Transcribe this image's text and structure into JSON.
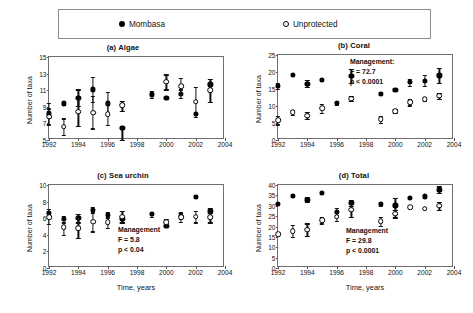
{
  "legend": {
    "items": [
      {
        "label": "Mombasa",
        "marker": "filled-circle-icon"
      },
      {
        "label": "Unprotected",
        "marker": "open-circle-icon"
      }
    ]
  },
  "axis_common": {
    "xlabel": "Time, years",
    "ylabel": "Number of taxa",
    "xlim": [
      1992,
      2004
    ],
    "xticks": [
      1992,
      1994,
      1996,
      1998,
      2000,
      2002,
      2004
    ]
  },
  "chart_data": [
    {
      "type": "scatter",
      "panel": "a",
      "title": "(a) Algae",
      "title_tag": "(a)",
      "title_name": "Algae",
      "xlabel": "",
      "ylabel": "Number of taxa",
      "xlim": [
        1992,
        2004
      ],
      "ylim": [
        5,
        15
      ],
      "yticks": [
        5,
        7,
        9,
        11,
        13,
        15
      ],
      "xticks": [
        1992,
        1994,
        1996,
        1998,
        2000,
        2002,
        2004
      ],
      "grid": false,
      "annotation": null,
      "series": [
        {
          "name": "Mombasa",
          "marker": "filled-circle",
          "x": [
            1992,
            1993,
            1994,
            1995,
            1996,
            1997,
            1999,
            2000,
            2001,
            2002,
            2003
          ],
          "values": [
            8.2,
            9.4,
            10.1,
            11.1,
            9.4,
            6.5,
            10.5,
            10.1,
            10.6,
            8.1,
            11.7
          ],
          "err_low": [
            1.3,
            0.0,
            1.0,
            1.5,
            1.2,
            1.5,
            0.4,
            0.0,
            0.5,
            0.0,
            0.0
          ],
          "err_high": [
            1.3,
            0.0,
            1.0,
            1.5,
            1.4,
            0.0,
            0.4,
            0.0,
            0.5,
            0.0,
            0.0
          ]
        },
        {
          "name": "Unprotected",
          "marker": "open-circle",
          "x": [
            1992,
            1993,
            1994,
            1995,
            1996,
            1997,
            2000,
            2001,
            2002,
            2003
          ],
          "values": [
            7.8,
            6.6,
            8.4,
            8.3,
            8.1,
            9.2,
            12.0,
            11.5,
            9.6,
            11.0
          ],
          "err_low": [
            1.0,
            1.0,
            1.7,
            1.9,
            1.3,
            0.7,
            0.9,
            1.0,
            1.8,
            1.4
          ],
          "err_high": [
            1.0,
            1.0,
            1.7,
            2.0,
            1.3,
            0.5,
            0.9,
            1.0,
            1.8,
            1.4
          ]
        }
      ]
    },
    {
      "type": "scatter",
      "panel": "b",
      "title": "(b) Coral",
      "title_tag": "(b)",
      "title_name": "Coral",
      "xlabel": "",
      "ylabel": "Number of taxa",
      "xlim": [
        1992,
        2004
      ],
      "ylim": [
        0,
        25
      ],
      "yticks": [
        0,
        5,
        10,
        15,
        20,
        25
      ],
      "xticks": [
        1992,
        1994,
        1996,
        1998,
        2000,
        2002,
        2004
      ],
      "grid": false,
      "annotation": {
        "line1": "Management:",
        "line2": "F = 72.7",
        "line3": "p <  0.0001"
      },
      "series": [
        {
          "name": "Mombasa",
          "marker": "filled-circle",
          "x": [
            1992,
            1993,
            1994,
            1995,
            1996,
            1997,
            1999,
            2000,
            2001,
            2002,
            2003
          ],
          "values": [
            16.0,
            19.2,
            16.6,
            17.7,
            10.8,
            18.8,
            13.6,
            14.8,
            17.0,
            17.5,
            19.0
          ],
          "err_low": [
            0.9,
            0.0,
            1.1,
            0.0,
            0.5,
            2.0,
            0.4,
            0.4,
            1.0,
            1.6,
            2.2
          ],
          "err_high": [
            0.9,
            0.0,
            1.1,
            0.0,
            0.5,
            2.0,
            0.4,
            0.4,
            1.0,
            1.6,
            2.2
          ]
        },
        {
          "name": "Unprotected",
          "marker": "open-circle",
          "x": [
            1992,
            1993,
            1994,
            1995,
            1997,
            1999,
            2000,
            2001,
            2002,
            2003
          ],
          "values": [
            5.8,
            8.1,
            7.2,
            9.3,
            12.2,
            6.1,
            8.5,
            11.1,
            12.0,
            13.0
          ],
          "err_low": [
            1.2,
            0.6,
            1.0,
            1.3,
            0.8,
            1.0,
            0.5,
            0.9,
            0.6,
            0.8
          ],
          "err_high": [
            1.2,
            0.6,
            1.0,
            1.3,
            0.8,
            1.0,
            0.5,
            0.9,
            0.6,
            0.8
          ]
        }
      ]
    },
    {
      "type": "scatter",
      "panel": "c",
      "title": "(c) Sea urchin",
      "title_tag": "(c)",
      "title_name": "Sea urchin",
      "xlabel": "Time, years",
      "ylabel": "Number of taxa",
      "xlim": [
        1992,
        2004
      ],
      "ylim": [
        0,
        10
      ],
      "yticks": [
        0,
        2,
        4,
        6,
        8,
        10
      ],
      "xticks": [
        1992,
        1994,
        1996,
        1998,
        2000,
        2002,
        2004
      ],
      "grid": false,
      "annotation": {
        "line1": "Management",
        "line2": "F =  5.8",
        "line3": "p < 0.04"
      },
      "series": [
        {
          "name": "Mombasa",
          "marker": "filled-circle",
          "x": [
            1992,
            1993,
            1994,
            1995,
            1996,
            1997,
            1999,
            2000,
            2001,
            2002,
            2003
          ],
          "values": [
            6.6,
            5.9,
            6.0,
            7.0,
            6.4,
            5.9,
            6.5,
            5.1,
            6.3,
            8.6,
            6.9
          ],
          "err_low": [
            0.5,
            0.4,
            0.5,
            0.4,
            0.4,
            0.4,
            0.3,
            0.0,
            0.4,
            0.2,
            0.3
          ],
          "err_high": [
            0.5,
            0.4,
            0.5,
            0.4,
            0.4,
            0.4,
            0.3,
            0.0,
            0.4,
            0.2,
            0.3
          ]
        },
        {
          "name": "Unprotected",
          "marker": "open-circle",
          "x": [
            1992,
            1993,
            1994,
            1995,
            1996,
            1997,
            2000,
            2001,
            2002,
            2003
          ],
          "values": [
            6.1,
            4.9,
            4.8,
            5.6,
            5.5,
            6.2,
            5.5,
            6.1,
            6.2,
            6.1
          ],
          "err_low": [
            0.8,
            0.9,
            1.2,
            1.2,
            0.7,
            0.7,
            0.4,
            0.5,
            0.7,
            0.6
          ],
          "err_high": [
            0.8,
            0.9,
            1.2,
            1.2,
            0.7,
            0.7,
            0.4,
            0.5,
            0.7,
            0.6
          ]
        }
      ]
    },
    {
      "type": "scatter",
      "panel": "d",
      "title": "(d) Total",
      "title_tag": "(d)",
      "title_name": "Total",
      "xlabel": "Time, years",
      "ylabel": "Number of taxa",
      "xlim": [
        1992,
        2004
      ],
      "ylim": [
        0,
        40
      ],
      "yticks": [
        0,
        5,
        10,
        15,
        20,
        25,
        30,
        35,
        40
      ],
      "xticks": [
        1992,
        1994,
        1996,
        1998,
        2000,
        2002,
        2004
      ],
      "grid": false,
      "annotation": {
        "line1": "Management",
        "line2": "F =   29.8",
        "line3": "p  < 0.0001"
      },
      "series": [
        {
          "name": "Mombasa",
          "marker": "filled-circle",
          "x": [
            1992,
            1993,
            1994,
            1995,
            1996,
            1997,
            1999,
            2000,
            2001,
            2002,
            2003
          ],
          "values": [
            31.0,
            34.8,
            33.0,
            36.0,
            27.2,
            31.5,
            31.0,
            30.2,
            33.8,
            34.5,
            37.8
          ],
          "err_low": [
            0.0,
            0.0,
            1.0,
            0.0,
            1.8,
            1.5,
            1.0,
            2.2,
            0.0,
            0.0,
            1.5
          ],
          "err_high": [
            0.0,
            0.0,
            1.0,
            0.0,
            1.8,
            1.5,
            1.0,
            3.5,
            0.0,
            0.0,
            1.5
          ]
        },
        {
          "name": "Unprotected",
          "marker": "open-circle",
          "x": [
            1992,
            1993,
            1994,
            1995,
            1996,
            1997,
            1999,
            2000,
            2001,
            2002,
            2003
          ],
          "values": [
            16.2,
            17.8,
            18.5,
            23.0,
            24.8,
            28.0,
            22.5,
            26.2,
            29.2,
            28.5,
            30.0
          ],
          "err_low": [
            0.0,
            2.8,
            3.0,
            1.5,
            2.0,
            3.5,
            2.2,
            1.8,
            0.0,
            0.0,
            2.0
          ],
          "err_high": [
            0.0,
            2.8,
            3.0,
            1.5,
            2.0,
            3.5,
            2.2,
            1.8,
            0.0,
            0.0,
            2.0
          ]
        }
      ]
    }
  ]
}
